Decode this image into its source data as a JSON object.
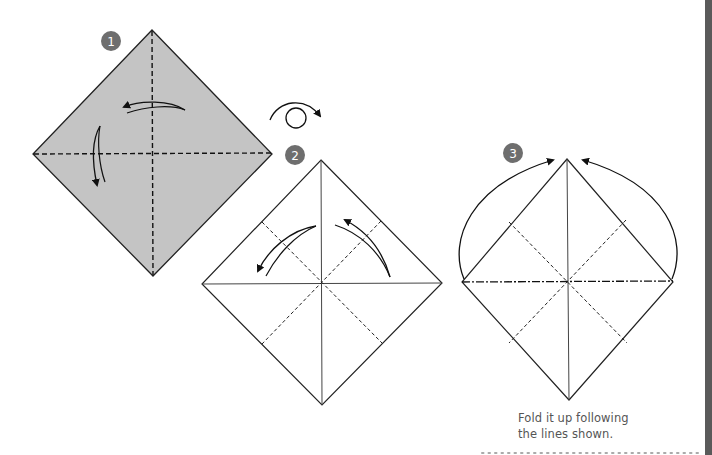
{
  "steps": [
    {
      "number": "1",
      "paper_color": "#c4c4c4",
      "state": "colored side up, fold both diagonals"
    },
    {
      "number": "2",
      "paper_color": "#ffffff",
      "state": "white side up, fold along dashed lines"
    },
    {
      "number": "3",
      "paper_color": "#ffffff",
      "state": "fold up following lines"
    }
  ],
  "turnover_symbol": "turn-over-icon",
  "caption": {
    "line1": "Fold it up following",
    "line2": "the lines shown."
  },
  "colors": {
    "badge": "#6e6e6e",
    "line": "#222222",
    "side_bar": "#5a5a5a",
    "caption": "#555555"
  }
}
